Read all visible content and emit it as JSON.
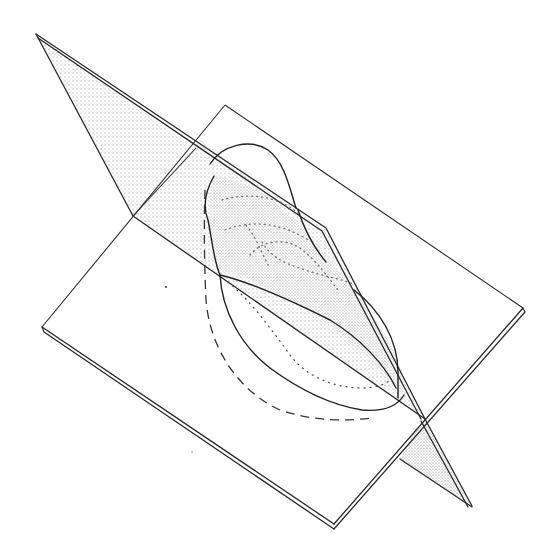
{
  "figure": {
    "title": "",
    "colors": {
      "ink": "#2a2a2a",
      "stipple": "#9a9a9a",
      "background": "#ffffff"
    },
    "elements": {
      "horizontal_plane": "Horizontal plane (parallelogram) with double-line front edges",
      "vertical_plane": "Vertical plane, stippled shading, with double-line top edge",
      "intersection_line": "Line of intersection between the two planes",
      "space_curve": "Solid closed curve in space",
      "projection_curve": "Dashed projection of curve onto horizontal plane",
      "dotted_trace": "Dotted trace on horizontal plane",
      "contours": "Dotted contour lines on the vertical plane"
    }
  }
}
